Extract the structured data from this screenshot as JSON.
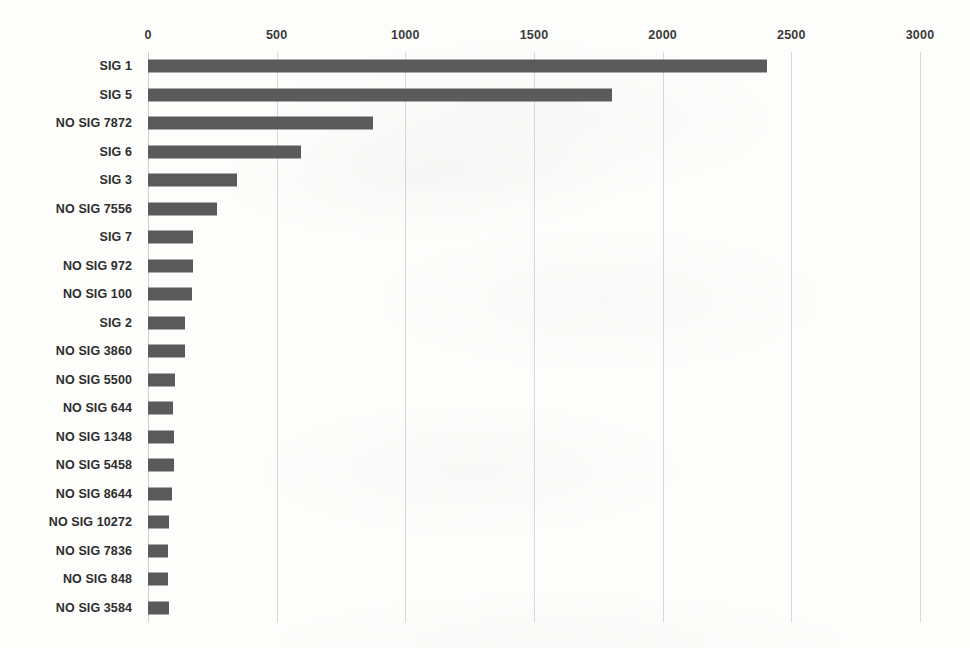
{
  "chart_data": {
    "type": "bar",
    "orientation": "horizontal",
    "title": "",
    "subtitle": "",
    "xlabel": "",
    "ylabel": "",
    "xlim": [
      0,
      3000
    ],
    "xticks": [
      "0",
      "500",
      "1000",
      "1500",
      "2000",
      "2500",
      "3000"
    ],
    "xtick_values": [
      0,
      500,
      1000,
      1500,
      2000,
      2500,
      3000
    ],
    "grid": true,
    "legend": false,
    "legend_position": "none",
    "bar_color": "#5a5a5a",
    "gridline_color": "#d9d9d9",
    "background_color": "#fdfdfc",
    "categories": [
      "SIG 1",
      "SIG 5",
      "NO SIG 7872",
      "SIG 6",
      "SIG 3",
      "NO SIG 7556",
      "SIG 7",
      "NO SIG 972",
      "NO SIG 100",
      "SIG 2",
      "NO SIG 3860",
      "NO SIG 5500",
      "NO SIG 644",
      "NO SIG 1348",
      "NO SIG 5458",
      "NO SIG 8644",
      "NO SIG 10272",
      "NO SIG 7836",
      "NO SIG 848",
      "NO SIG 3584"
    ],
    "values": [
      2406,
      1803,
      875,
      595,
      346,
      268,
      175,
      175,
      171,
      144,
      144,
      105,
      97,
      101,
      101,
      93,
      82,
      78,
      78,
      82
    ]
  }
}
